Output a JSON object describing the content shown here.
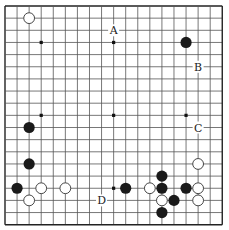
{
  "board": {
    "size": 19,
    "origin_x": 5,
    "origin_y": 6,
    "step_x": 12.07,
    "step_y": 12.15,
    "line_color": "#555555",
    "edge_color": "#222222",
    "star_points": [
      [
        3,
        3
      ],
      [
        9,
        3
      ],
      [
        15,
        3
      ],
      [
        3,
        9
      ],
      [
        9,
        9
      ],
      [
        15,
        9
      ],
      [
        3,
        15
      ],
      [
        9,
        15
      ],
      [
        15,
        15
      ]
    ]
  },
  "stones": {
    "black": [
      [
        15,
        3
      ],
      [
        2,
        10
      ],
      [
        2,
        13
      ],
      [
        1,
        15
      ],
      [
        13,
        14
      ],
      [
        10,
        15
      ],
      [
        13,
        15
      ],
      [
        15,
        15
      ],
      [
        14,
        16
      ],
      [
        13,
        17
      ]
    ],
    "white": [
      [
        2,
        1
      ],
      [
        3,
        15
      ],
      [
        5,
        15
      ],
      [
        2,
        16
      ],
      [
        16,
        13
      ],
      [
        12,
        15
      ],
      [
        16,
        15
      ],
      [
        13,
        16
      ],
      [
        16,
        16
      ]
    ]
  },
  "labels": [
    {
      "text": "A",
      "col": 9,
      "row": 2
    },
    {
      "text": "B",
      "col": 16,
      "row": 5
    },
    {
      "text": "C",
      "col": 16,
      "row": 10
    },
    {
      "text": "D",
      "col": 8,
      "row": 16
    }
  ],
  "colors": {
    "black_stone": "#1a1a1a",
    "white_stone": "#ffffff",
    "white_stroke": "#333333"
  }
}
